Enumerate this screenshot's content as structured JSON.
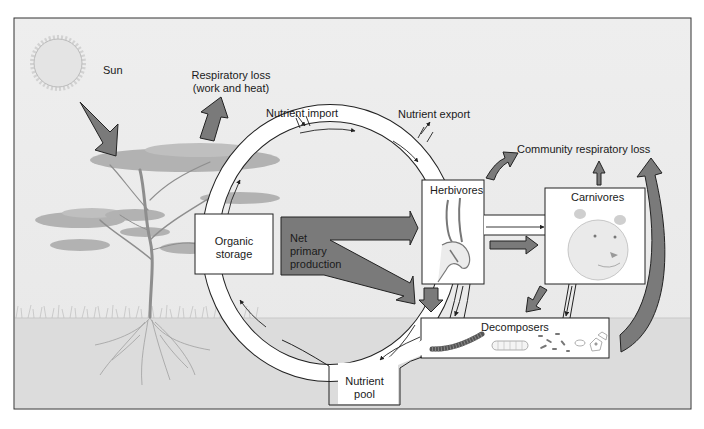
{
  "diagram": {
    "type": "ecosystem energy flow and nutrient cycling",
    "labels": {
      "sun": "Sun",
      "respiratory_loss_line1": "Respiratory loss",
      "respiratory_loss_line2": "(work and heat)",
      "nutrient_import": "Nutrient import",
      "nutrient_export": "Nutrient export",
      "community_respiratory_loss": "Community respiratory loss",
      "herbivores": "Herbivores",
      "carnivores": "Carnivores",
      "organic_storage_line1": "Organic",
      "organic_storage_line2": "storage",
      "npp_line1": "Net",
      "npp_line2": "primary",
      "npp_line3": "production",
      "decomposers": "Decomposers",
      "nutrient_pool_line1": "Nutrient",
      "nutrient_pool_line2": "pool"
    },
    "colors": {
      "sky": "#ececec",
      "ground": "#dcdcdc",
      "energy_arrow": "#7a7a7a",
      "box_fill": "#ffffff",
      "outline": "#2a2a2a"
    }
  }
}
